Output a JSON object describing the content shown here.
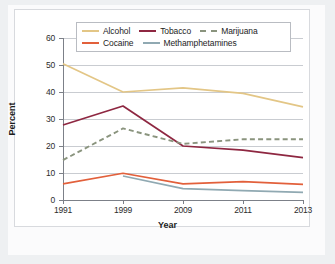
{
  "chart_data": {
    "type": "line",
    "title": "",
    "xlabel": "Year",
    "ylabel": "Percent",
    "categories": [
      "1991",
      "1999",
      "2009",
      "2011",
      "2013"
    ],
    "x": [
      1991,
      1999,
      2009,
      2011,
      2013
    ],
    "ylim": [
      0,
      60
    ],
    "yticks": [
      0,
      10,
      20,
      30,
      40,
      50,
      60
    ],
    "grid": "horizontal",
    "legend_position": "top",
    "series": [
      {
        "name": "Alcohol",
        "values": [
          50.5,
          40.0,
          41.5,
          39.5,
          34.5
        ],
        "color": "#E3C686",
        "style": "solid"
      },
      {
        "name": "Tobacco",
        "values": [
          27.8,
          34.8,
          20.0,
          18.5,
          15.7
        ],
        "color": "#8E2741",
        "style": "solid"
      },
      {
        "name": "Marijuana",
        "values": [
          14.8,
          26.5,
          20.8,
          22.5,
          22.5
        ],
        "color": "#8A947E",
        "style": "dashed"
      },
      {
        "name": "Cocaine",
        "values": [
          6.0,
          9.9,
          6.0,
          6.8,
          5.8
        ],
        "color": "#E2603B",
        "style": "solid"
      },
      {
        "name": "Methamphetamines",
        "values": [
          null,
          8.9,
          4.2,
          3.5,
          2.8
        ],
        "color": "#90A9B2",
        "style": "solid"
      }
    ]
  },
  "legend": {
    "rows": [
      [
        {
          "label": "Alcohol",
          "color": "#E3C686",
          "style": "solid"
        },
        {
          "label": "Tobacco",
          "color": "#8E2741",
          "style": "solid"
        },
        {
          "label": "Marijuana",
          "color": "#8A947E",
          "style": "dashed"
        }
      ],
      [
        {
          "label": "Cocaine",
          "color": "#E2603B",
          "style": "solid"
        },
        {
          "label": "Methamphetamines",
          "color": "#90A9B2",
          "style": "solid"
        }
      ]
    ]
  },
  "axes": {
    "y_label": "Percent",
    "x_label": "Year",
    "y_ticks": [
      "0",
      "10",
      "20",
      "30",
      "40",
      "50",
      "60"
    ],
    "x_ticks": [
      "1991",
      "1999",
      "2009",
      "2011",
      "2013"
    ]
  }
}
